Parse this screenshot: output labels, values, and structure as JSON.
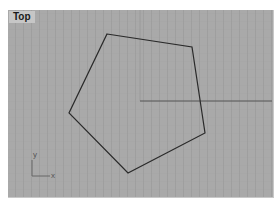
{
  "viewport": {
    "label": "Top",
    "background": "#a9a9a9",
    "label_background": "#c6c6c6"
  },
  "geometry": {
    "shape": "pentagon",
    "stroke": "#2a2a2a",
    "vertices": [
      [
        107,
        34
      ],
      [
        192,
        47
      ],
      [
        205,
        133
      ],
      [
        128,
        173
      ],
      [
        69,
        113
      ]
    ]
  },
  "world_axes": {
    "x_axis_color": "#555555",
    "y_axis_color": "#9a9a9a",
    "origin": [
      140,
      101
    ]
  },
  "axis_icon": {
    "x_label": "x",
    "y_label": "y"
  }
}
